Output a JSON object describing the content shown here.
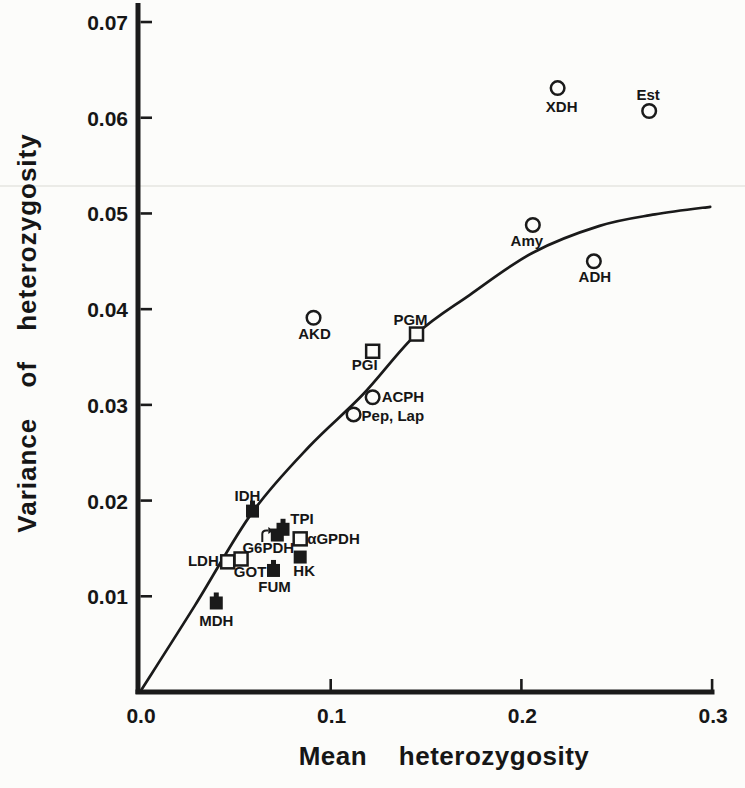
{
  "style": {
    "ink": "#1a1a1a",
    "paper": "#fcfcfa",
    "text": "#161616"
  },
  "chart_data": {
    "type": "scatter",
    "title": "",
    "xlabel": "Mean heterozygosity",
    "ylabel": "Variance of heterozygosity",
    "xlim": [
      0.0,
      0.3
    ],
    "ylim": [
      0.0,
      0.07
    ],
    "grid": false,
    "legend_position": "none",
    "x_ticks": [
      {
        "value": 0.0,
        "label": "0.0",
        "mark": false
      },
      {
        "value": 0.1,
        "label": "0.1",
        "mark": true
      },
      {
        "value": 0.2,
        "label": "0.2",
        "mark": true
      },
      {
        "value": 0.3,
        "label": "0.3",
        "mark": true
      }
    ],
    "y_ticks": [
      {
        "value": 0.01,
        "label": "0.01"
      },
      {
        "value": 0.02,
        "label": "0.02"
      },
      {
        "value": 0.03,
        "label": "0.03"
      },
      {
        "value": 0.04,
        "label": "0.04"
      },
      {
        "value": 0.05,
        "label": "0.05"
      },
      {
        "value": 0.06,
        "label": "0.06"
      },
      {
        "value": 0.07,
        "label": "0.07"
      }
    ],
    "series": [
      {
        "name": "open-circle-loci",
        "marker": "open-circle",
        "points": [
          {
            "label": "XDH",
            "x": 0.219,
            "y": 0.0631,
            "label_dx": 4,
            "label_dy": 24,
            "label_anchor": "middle"
          },
          {
            "label": "Est",
            "x": 0.267,
            "y": 0.0607,
            "label_dx": -1,
            "label_dy": -11,
            "label_anchor": "middle"
          },
          {
            "label": "Amy",
            "x": 0.206,
            "y": 0.0488,
            "label_dx": -6,
            "label_dy": 21,
            "label_anchor": "middle"
          },
          {
            "label": "ADH",
            "x": 0.238,
            "y": 0.045,
            "label_dx": 1,
            "label_dy": 21,
            "label_anchor": "middle"
          },
          {
            "label": "AKD",
            "x": 0.091,
            "y": 0.0391,
            "label_dx": 1,
            "label_dy": 21,
            "label_anchor": "middle"
          },
          {
            "label": "ACPH",
            "x": 0.122,
            "y": 0.0308,
            "label_dx": 9,
            "label_dy": 5,
            "label_anchor": "start"
          },
          {
            "label": "Pep, Lap",
            "x": 0.112,
            "y": 0.029,
            "label_dx": 8,
            "label_dy": 7,
            "label_anchor": "start"
          }
        ]
      },
      {
        "name": "open-square-loci",
        "marker": "open-square",
        "points": [
          {
            "label": "PGM",
            "x": 0.145,
            "y": 0.0374,
            "label_dx": -6,
            "label_dy": -9,
            "label_anchor": "middle"
          },
          {
            "label": "PGI",
            "x": 0.122,
            "y": 0.0356,
            "label_dx": -8,
            "label_dy": 19,
            "label_anchor": "middle"
          },
          {
            "label": "αGPDH",
            "x": 0.084,
            "y": 0.016,
            "label_dx": 7,
            "label_dy": 5,
            "label_anchor": "start"
          },
          {
            "label": "LDH",
            "x": 0.046,
            "y": 0.0136,
            "label_dx": -9,
            "label_dy": 4,
            "label_anchor": "end"
          },
          {
            "label": "GOT",
            "x": 0.053,
            "y": 0.0139,
            "label_dx": 9,
            "label_dy": 18,
            "label_anchor": "middle"
          }
        ]
      },
      {
        "name": "filled-square-loci",
        "marker": "filled-square",
        "points": [
          {
            "label": "IDH",
            "x": 0.059,
            "y": 0.0189,
            "label_dx": -5,
            "label_dy": -10,
            "label_anchor": "middle",
            "nub": true
          },
          {
            "label": "TPI",
            "x": 0.075,
            "y": 0.017,
            "label_dx": 19,
            "label_dy": -5,
            "label_anchor": "middle",
            "nub": true
          },
          {
            "label": "G6PDH",
            "x": 0.072,
            "y": 0.0164,
            "label_dx": -9,
            "label_dy": 18,
            "label_anchor": "middle",
            "arrow": true
          },
          {
            "label": "HK",
            "x": 0.084,
            "y": 0.0141,
            "label_dx": 4,
            "label_dy": 19,
            "label_anchor": "middle"
          },
          {
            "label": "FUM",
            "x": 0.07,
            "y": 0.0127,
            "label_dx": 1,
            "label_dy": 22,
            "label_anchor": "middle",
            "nub": true
          },
          {
            "label": "MDH",
            "x": 0.04,
            "y": 0.0093,
            "label_dx": 0,
            "label_dy": 23,
            "label_anchor": "middle",
            "nub": true
          }
        ]
      }
    ],
    "curve": {
      "description": "smooth fitted curve rising from origin and flattening near x=0.3",
      "points": [
        [
          0.0,
          0.0
        ],
        [
          0.029,
          0.0091
        ],
        [
          0.059,
          0.0188
        ],
        [
          0.089,
          0.0257
        ],
        [
          0.117,
          0.0311
        ],
        [
          0.145,
          0.0374
        ],
        [
          0.173,
          0.0415
        ],
        [
          0.206,
          0.0459
        ],
        [
          0.241,
          0.0487
        ],
        [
          0.27,
          0.0499
        ],
        [
          0.299,
          0.0507
        ]
      ]
    }
  }
}
